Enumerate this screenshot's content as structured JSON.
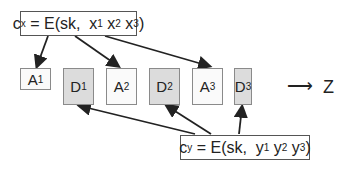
{
  "formula_x": {
    "c": "c",
    "c_sub": "x",
    "eq": " = E(sk,  ",
    "v1": "x",
    "s1": "1",
    "v2": "x",
    "s2": "2",
    "v3": "x",
    "s3": "3",
    "close": ")"
  },
  "formula_y": {
    "c": "c",
    "c_sub": "y",
    "eq": " = E(sk,  ",
    "v1": "y",
    "s1": "1",
    "v2": "y",
    "s2": "2",
    "v3": "y",
    "s3": "3",
    "close": ")"
  },
  "blocks": [
    {
      "letter": "A",
      "sub": "1",
      "type": "light"
    },
    {
      "letter": "D",
      "sub": "1",
      "type": "dark"
    },
    {
      "letter": "A",
      "sub": "2",
      "type": "light"
    },
    {
      "letter": "D",
      "sub": "2",
      "type": "dark"
    },
    {
      "letter": "A",
      "sub": "3",
      "type": "light"
    },
    {
      "letter": "D",
      "sub": "3",
      "type": "dark"
    }
  ],
  "arrow_symbol": "⟶",
  "result": "Z"
}
